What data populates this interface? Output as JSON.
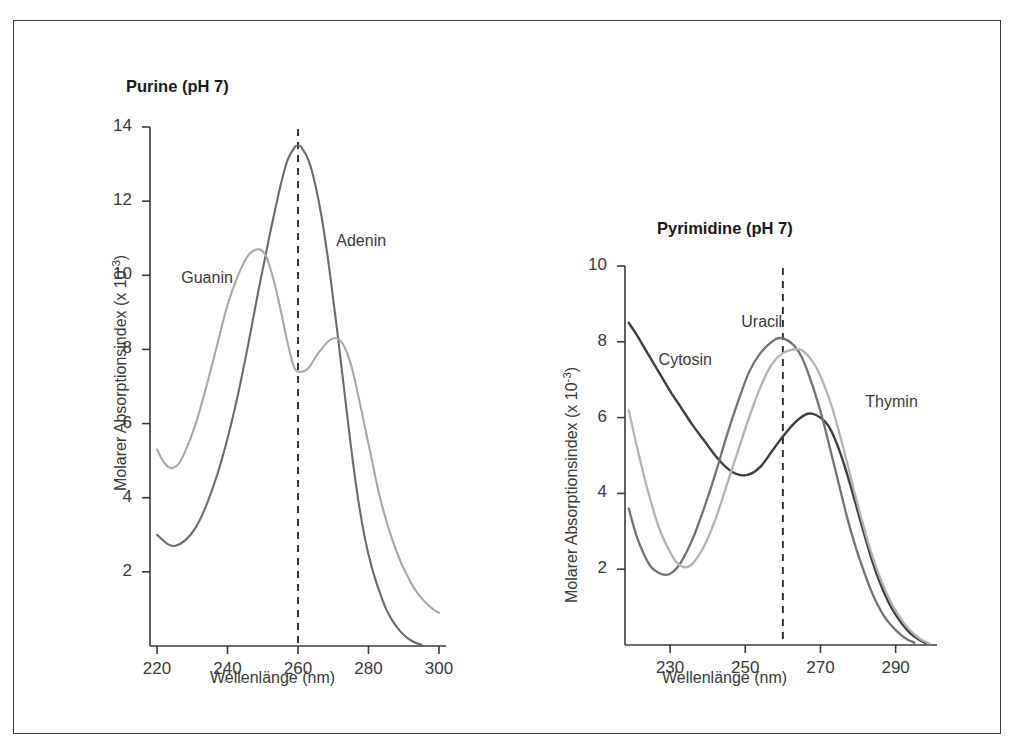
{
  "figure": {
    "background": "#ffffff",
    "frame_color": "#3a3a3a"
  },
  "chart_data": [
    {
      "id": "purine",
      "type": "line",
      "title": "Purine (pH 7)",
      "xlabel": "Wellenlänge (nm)",
      "ylabel": "Molarer Absorptionsindex (x 10",
      "ylabel_exp": "-3",
      "ylabel_close": ")",
      "xlim": [
        218,
        302
      ],
      "ylim": [
        0,
        14
      ],
      "xticks": [
        220,
        240,
        260,
        280,
        300
      ],
      "yticks": [
        2,
        4,
        6,
        8,
        10,
        12,
        14
      ],
      "grid": false,
      "legend": "inline-annotations",
      "annotations": [
        {
          "text": "Guanin",
          "x": 228,
          "y": 10.0
        },
        {
          "text": "Adenin",
          "x": 272,
          "y": 11.0
        }
      ],
      "reference_line": {
        "x": 260,
        "style": "dashed",
        "color": "#2b2b2b"
      },
      "series": [
        {
          "name": "Adenin",
          "color": "#6b6b6b",
          "width": 2.1,
          "points": [
            [
              220,
              3.0
            ],
            [
              223,
              2.75
            ],
            [
              225,
              2.7
            ],
            [
              228,
              2.85
            ],
            [
              231,
              3.2
            ],
            [
              234,
              3.8
            ],
            [
              237,
              4.6
            ],
            [
              240,
              5.6
            ],
            [
              243,
              6.8
            ],
            [
              246,
              8.2
            ],
            [
              249,
              9.7
            ],
            [
              252,
              11.1
            ],
            [
              255,
              12.4
            ],
            [
              257,
              13.1
            ],
            [
              259,
              13.45
            ],
            [
              260,
              13.5
            ],
            [
              261,
              13.45
            ],
            [
              263,
              13.1
            ],
            [
              265,
              12.4
            ],
            [
              267,
              11.4
            ],
            [
              269,
              10.1
            ],
            [
              271,
              8.6
            ],
            [
              273,
              7.0
            ],
            [
              275,
              5.4
            ],
            [
              277,
              4.0
            ],
            [
              279,
              2.9
            ],
            [
              281,
              2.1
            ],
            [
              283,
              1.5
            ],
            [
              285,
              1.0
            ],
            [
              287,
              0.65
            ],
            [
              289,
              0.4
            ],
            [
              291,
              0.22
            ],
            [
              293,
              0.1
            ],
            [
              295,
              0.04
            ]
          ]
        },
        {
          "name": "Guanin",
          "color": "#a8a8a8",
          "width": 2.1,
          "points": [
            [
              220,
              5.3
            ],
            [
              222,
              4.95
            ],
            [
              224,
              4.8
            ],
            [
              226,
              4.9
            ],
            [
              228,
              5.25
            ],
            [
              231,
              6.0
            ],
            [
              234,
              7.0
            ],
            [
              237,
              8.1
            ],
            [
              240,
              9.2
            ],
            [
              243,
              10.0
            ],
            [
              246,
              10.55
            ],
            [
              249,
              10.7
            ],
            [
              251,
              10.5
            ],
            [
              253,
              9.9
            ],
            [
              255,
              9.1
            ],
            [
              257,
              8.2
            ],
            [
              259,
              7.5
            ],
            [
              261,
              7.4
            ],
            [
              263,
              7.5
            ],
            [
              265,
              7.8
            ],
            [
              267,
              8.05
            ],
            [
              269,
              8.25
            ],
            [
              271,
              8.3
            ],
            [
              273,
              8.1
            ],
            [
              275,
              7.6
            ],
            [
              277,
              6.8
            ],
            [
              279,
              5.9
            ],
            [
              281,
              5.0
            ],
            [
              283,
              4.1
            ],
            [
              285,
              3.4
            ],
            [
              287,
              2.8
            ],
            [
              289,
              2.3
            ],
            [
              291,
              1.9
            ],
            [
              293,
              1.55
            ],
            [
              295,
              1.3
            ],
            [
              297,
              1.1
            ],
            [
              299,
              0.95
            ],
            [
              300,
              0.9
            ]
          ]
        }
      ]
    },
    {
      "id": "pyrimidine",
      "type": "line",
      "title": "Pyrimidine (pH 7)",
      "xlabel": "Wellenlänge (nm)",
      "ylabel": "Molarer Absorptionsindex (x 10",
      "ylabel_exp": "-3",
      "ylabel_close": ")",
      "xlim": [
        218,
        301
      ],
      "ylim": [
        0,
        10
      ],
      "xticks": [
        230,
        250,
        270,
        290
      ],
      "yticks": [
        2,
        4,
        6,
        8,
        10
      ],
      "grid": false,
      "legend": "inline-annotations",
      "annotations": [
        {
          "text": "Cytosin",
          "x": 228,
          "y": 7.6
        },
        {
          "text": "Uracil",
          "x": 250,
          "y": 8.6
        },
        {
          "text": "Thymin",
          "x": 283,
          "y": 6.5
        }
      ],
      "reference_line": {
        "x": 260,
        "style": "dashed",
        "color": "#2b2b2b"
      },
      "series": [
        {
          "name": "Cytosin",
          "color": "#3f3f3f",
          "width": 2.4,
          "points": [
            [
              219,
              8.5
            ],
            [
              221,
              8.2
            ],
            [
              224,
              7.7
            ],
            [
              227,
              7.2
            ],
            [
              230,
              6.7
            ],
            [
              233,
              6.25
            ],
            [
              236,
              5.8
            ],
            [
              239,
              5.4
            ],
            [
              242,
              5.0
            ],
            [
              245,
              4.68
            ],
            [
              248,
              4.5
            ],
            [
              251,
              4.5
            ],
            [
              254,
              4.7
            ],
            [
              257,
              5.1
            ],
            [
              260,
              5.5
            ],
            [
              263,
              5.85
            ],
            [
              266,
              6.08
            ],
            [
              268,
              6.1
            ],
            [
              270,
              6.0
            ],
            [
              272,
              5.8
            ],
            [
              274,
              5.4
            ],
            [
              276,
              4.85
            ],
            [
              278,
              4.2
            ],
            [
              280,
              3.5
            ],
            [
              282,
              2.8
            ],
            [
              284,
              2.15
            ],
            [
              286,
              1.6
            ],
            [
              288,
              1.15
            ],
            [
              290,
              0.8
            ],
            [
              292,
              0.52
            ],
            [
              294,
              0.3
            ],
            [
              296,
              0.15
            ],
            [
              298,
              0.05
            ]
          ]
        },
        {
          "name": "Uracil",
          "color": "#737373",
          "width": 2.3,
          "points": [
            [
              219,
              3.6
            ],
            [
              221,
              2.9
            ],
            [
              223,
              2.4
            ],
            [
              225,
              2.05
            ],
            [
              227,
              1.9
            ],
            [
              229,
              1.85
            ],
            [
              231,
              1.95
            ],
            [
              233,
              2.2
            ],
            [
              236,
              2.8
            ],
            [
              239,
              3.6
            ],
            [
              242,
              4.5
            ],
            [
              245,
              5.5
            ],
            [
              248,
              6.4
            ],
            [
              251,
              7.2
            ],
            [
              254,
              7.7
            ],
            [
              257,
              8.0
            ],
            [
              259,
              8.1
            ],
            [
              261,
              8.05
            ],
            [
              263,
              7.9
            ],
            [
              265,
              7.6
            ],
            [
              267,
              7.1
            ],
            [
              269,
              6.5
            ],
            [
              271,
              5.8
            ],
            [
              273,
              5.0
            ],
            [
              275,
              4.2
            ],
            [
              277,
              3.4
            ],
            [
              279,
              2.7
            ],
            [
              281,
              2.1
            ],
            [
              283,
              1.55
            ],
            [
              285,
              1.1
            ],
            [
              287,
              0.75
            ],
            [
              289,
              0.5
            ],
            [
              291,
              0.3
            ],
            [
              293,
              0.15
            ],
            [
              295,
              0.06
            ]
          ]
        },
        {
          "name": "Thymin",
          "color": "#b3b3b3",
          "width": 2.3,
          "points": [
            [
              219,
              6.2
            ],
            [
              221,
              5.3
            ],
            [
              224,
              4.1
            ],
            [
              227,
              3.1
            ],
            [
              230,
              2.45
            ],
            [
              232,
              2.15
            ],
            [
              234,
              2.05
            ],
            [
              236,
              2.15
            ],
            [
              239,
              2.6
            ],
            [
              242,
              3.3
            ],
            [
              245,
              4.2
            ],
            [
              248,
              5.1
            ],
            [
              251,
              6.0
            ],
            [
              254,
              6.8
            ],
            [
              257,
              7.4
            ],
            [
              260,
              7.7
            ],
            [
              263,
              7.8
            ],
            [
              265,
              7.78
            ],
            [
              267,
              7.6
            ],
            [
              269,
              7.3
            ],
            [
              271,
              6.85
            ],
            [
              273,
              6.3
            ],
            [
              275,
              5.6
            ],
            [
              277,
              4.85
            ],
            [
              279,
              4.05
            ],
            [
              281,
              3.3
            ],
            [
              283,
              2.6
            ],
            [
              285,
              2.0
            ],
            [
              287,
              1.5
            ],
            [
              289,
              1.08
            ],
            [
              291,
              0.75
            ],
            [
              293,
              0.48
            ],
            [
              295,
              0.28
            ],
            [
              297,
              0.13
            ],
            [
              299,
              0.04
            ]
          ]
        }
      ]
    }
  ]
}
